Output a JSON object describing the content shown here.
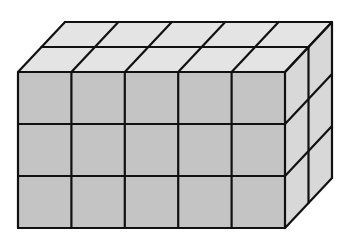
{
  "diagram": {
    "dimensions": {
      "columns": 5,
      "rows": 3,
      "depth": 2
    },
    "colors": {
      "background": "#ffffff",
      "front_face": "#c4c4c4",
      "top_face": "#e4e4e4",
      "side_face": "#d8d8d8",
      "edge": "#111111"
    },
    "geometry": {
      "front_left": 18,
      "front_top": 72,
      "cell_w": 53.4,
      "cell_h": 52,
      "depth_dx": 47,
      "depth_dy": -50
    }
  }
}
